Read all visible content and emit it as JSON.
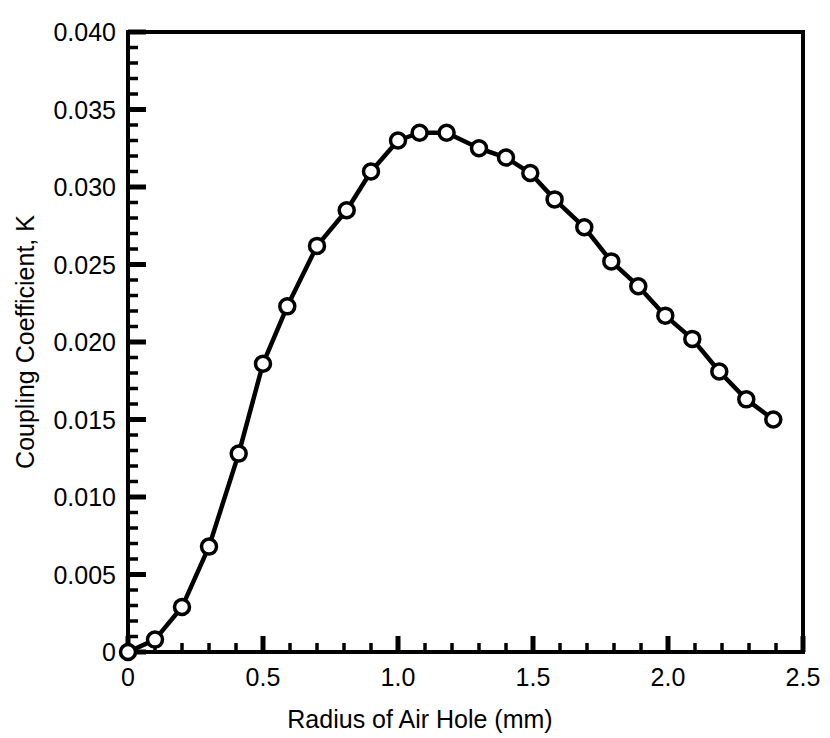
{
  "chart_data": {
    "type": "line",
    "title": "",
    "subtitle": "",
    "xlabel": "Radius of Air Hole (mm)",
    "ylabel": "Coupling Coefficient, K",
    "xlim": [
      0,
      2.5
    ],
    "ylim": [
      0,
      0.04
    ],
    "grid": false,
    "legend": null,
    "marker": "open-circle",
    "line_color": "#000000",
    "marker_face_color": "#ffffff",
    "marker_edge_color": "#000000",
    "x_major_ticks": [
      0,
      0.5,
      1.0,
      1.5,
      2.0,
      2.5
    ],
    "x_major_tick_labels": [
      "0",
      "0.5",
      "1.0",
      "1.5",
      "2.0",
      "2.5"
    ],
    "x_minor_tick_step": 0.1,
    "y_major_ticks": [
      0,
      0.005,
      0.01,
      0.015,
      0.02,
      0.025,
      0.03,
      0.035,
      0.04
    ],
    "y_major_tick_labels": [
      "0",
      "0.005",
      "0.010",
      "0.015",
      "0.020",
      "0.025",
      "0.030",
      "0.035",
      "0.040"
    ],
    "y_minor_tick_step": 0.001,
    "series": [
      {
        "name": "Coupling Coefficient",
        "x": [
          0.0,
          0.1,
          0.2,
          0.3,
          0.41,
          0.5,
          0.59,
          0.7,
          0.81,
          0.9,
          1.0,
          1.08,
          1.18,
          1.3,
          1.4,
          1.49,
          1.58,
          1.69,
          1.79,
          1.89,
          1.99,
          2.09,
          2.19,
          2.29,
          2.39
        ],
        "y": [
          0.0,
          0.0008,
          0.0029,
          0.0068,
          0.0128,
          0.0186,
          0.0223,
          0.0262,
          0.0285,
          0.031,
          0.033,
          0.0335,
          0.0335,
          0.0325,
          0.0319,
          0.0309,
          0.0292,
          0.0274,
          0.0252,
          0.0236,
          0.0217,
          0.0202,
          0.0181,
          0.0163,
          0.015
        ]
      }
    ]
  },
  "figure": {
    "background_color": "#ffffff",
    "frame_color": "#000000"
  }
}
